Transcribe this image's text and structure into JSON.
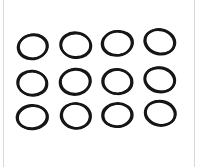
{
  "image": {
    "description": "Twelve black elastic rubber rings (O-rings) arranged in a 3x4 grid on a white background",
    "background_color": "#ffffff",
    "frame_border_color": "#d9d9d9",
    "ring_color": "#161616",
    "grid": {
      "rows": 3,
      "columns": 4,
      "count": 12
    },
    "rings": [
      {
        "cx": 32.5,
        "cy": 47.0,
        "rx": 14.5,
        "ry": 12.0,
        "rot": -8,
        "sw": 2.6,
        "dx": 0.9,
        "dy": -0.5
      },
      {
        "cx": 75.5,
        "cy": 45.0,
        "rx": 15.0,
        "ry": 12.3,
        "rot": 6,
        "sw": 2.6,
        "dx": 0.8,
        "dy": 0.6
      },
      {
        "cx": 117.0,
        "cy": 43.5,
        "rx": 15.0,
        "ry": 12.0,
        "rot": -6,
        "sw": 2.6,
        "dx": 1.0,
        "dy": -0.4
      },
      {
        "cx": 159.5,
        "cy": 42.0,
        "rx": 15.0,
        "ry": 12.0,
        "rot": 14,
        "sw": 2.6,
        "dx": 0.7,
        "dy": -0.8
      },
      {
        "cx": 32.0,
        "cy": 83.0,
        "rx": 14.5,
        "ry": 12.0,
        "rot": 5,
        "sw": 2.6,
        "dx": 0.9,
        "dy": 0.5
      },
      {
        "cx": 75.0,
        "cy": 82.0,
        "rx": 15.0,
        "ry": 12.5,
        "rot": -7,
        "sw": 2.7,
        "dx": 0.8,
        "dy": -0.6
      },
      {
        "cx": 117.0,
        "cy": 81.5,
        "rx": 14.5,
        "ry": 12.2,
        "rot": 4,
        "sw": 2.6,
        "dx": 1.0,
        "dy": 0.3
      },
      {
        "cx": 159.5,
        "cy": 80.0,
        "rx": 15.0,
        "ry": 12.0,
        "rot": 12,
        "sw": 2.6,
        "dx": 0.6,
        "dy": -0.8
      },
      {
        "cx": 32.0,
        "cy": 117.0,
        "rx": 15.0,
        "ry": 11.6,
        "rot": -5,
        "sw": 2.7,
        "dx": 0.8,
        "dy": 0.6
      },
      {
        "cx": 75.5,
        "cy": 116.0,
        "rx": 14.5,
        "ry": 12.4,
        "rot": 8,
        "sw": 2.6,
        "dx": 0.9,
        "dy": -0.4
      },
      {
        "cx": 117.0,
        "cy": 115.0,
        "rx": 14.6,
        "ry": 11.6,
        "rot": -4,
        "sw": 2.6,
        "dx": 1.0,
        "dy": 0.4
      },
      {
        "cx": 160.0,
        "cy": 113.5,
        "rx": 15.0,
        "ry": 12.0,
        "rot": 10,
        "sw": 2.6,
        "dx": 0.7,
        "dy": -0.7
      }
    ]
  }
}
